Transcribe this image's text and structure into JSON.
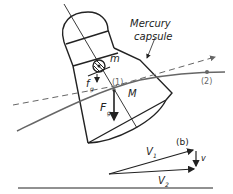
{
  "diagram": {
    "labels": {
      "capsule_name_line1": "Mercury",
      "capsule_name_line2": "capsule",
      "small_mass": "m",
      "small_force": "f",
      "small_force_sub": "g",
      "point1": "(1)",
      "point2": "(2)",
      "large_mass": "M",
      "large_force": "F",
      "large_force_sub": "g",
      "panel_b": "(b)",
      "v1": "V",
      "v1_sub": "1",
      "v2": "V",
      "v2_sub": "2",
      "small_v": "v"
    },
    "colors": {
      "ink": "#222222",
      "trajectory": "#666666"
    }
  }
}
